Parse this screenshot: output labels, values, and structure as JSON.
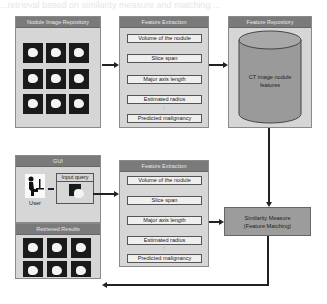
{
  "background_text": {
    "top": "...retrieval based on similarity measure and matching ...",
    "bottom": "..."
  },
  "nodule_repository": {
    "title": "Nodule Image Repository",
    "tile_count": 9
  },
  "feature_extraction_top": {
    "title": "Feature Extraction",
    "features": [
      "Volume of the nodule",
      "Slice span",
      "Major axis length",
      "Estimated radius",
      "Predicted malignancy"
    ],
    "ellipsis": ":"
  },
  "feature_repository": {
    "title": "Feature Repository",
    "db_label_line1": "CT image nodule",
    "db_label_line2": "features"
  },
  "gui": {
    "title": "GUI",
    "user_label": "User",
    "input_query_label": "Input query"
  },
  "retrieved_results": {
    "title": "Retrieved Results",
    "tile_count": 6
  },
  "feature_extraction_bottom": {
    "title": "Feature Extraction",
    "features": [
      "Volume of the nodule",
      "Slice span",
      "Major axis length",
      "Estimated radius",
      "Predicted malignancy"
    ],
    "ellipsis": ":"
  },
  "similarity": {
    "line1": "Similarity Measure",
    "line2": "(Feature Matching)"
  },
  "colors": {
    "panel_bg": "#d6d6d6",
    "title_bar": "#7a7a7a",
    "db_fill": "#9a9a9a",
    "similarity_fill": "#9c9c9c",
    "tile_bg": "#1a1a1a"
  }
}
